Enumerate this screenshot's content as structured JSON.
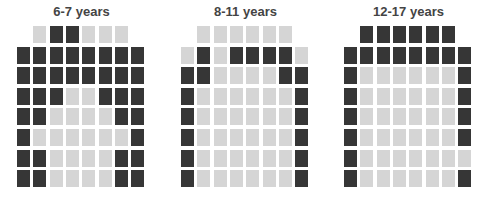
{
  "chart_data": {
    "type": "waffle",
    "legend": [],
    "colors": {
      "dark": "#363636",
      "light": "#d5d5d5"
    },
    "panels": [
      {
        "title": "6-7 years",
        "rows": [
          "LDDLLL",
          "DDDDDDDD",
          "DDDDDDDD",
          "DDDLLDDD",
          "DDLLLLDD",
          "DLLLLLLD",
          "DDLLLLDD",
          "DDLLLLDD"
        ],
        "dark_count": 36,
        "light_count": 26
      },
      {
        "title": "8-11 years",
        "rows": [
          "LLLLLL",
          "LDLDDDDL",
          "DDLLLLDD",
          "DLLLLLLD",
          "DLLLLLLD",
          "DLLLLLLD",
          "DLLLLLLD",
          "DLLLLLLD"
        ],
        "dark_count": 19,
        "light_count": 43
      },
      {
        "title": "12-17 years",
        "rows": [
          "DDDDDD",
          "DDDDDDDD",
          "DLLLLLLD",
          "DLLLLLLD",
          "DLLLLLLD",
          "DLLLLLLD",
          "DLLLLLLL",
          "DLLLLLLD"
        ],
        "dark_count": 25,
        "light_count": 37
      }
    ]
  },
  "panels": [
    {
      "title": "6-7 years"
    },
    {
      "title": "8-11 years"
    },
    {
      "title": "12-17 years"
    }
  ]
}
